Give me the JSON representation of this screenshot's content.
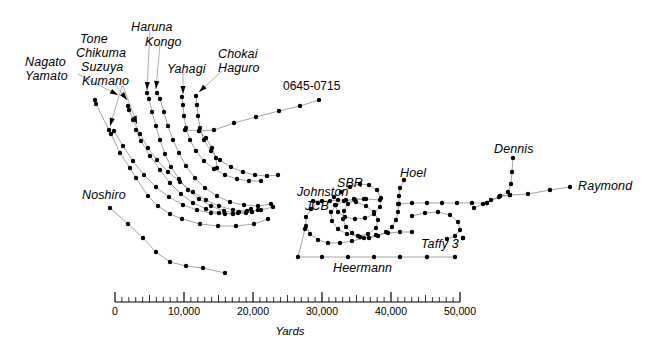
{
  "timestamp": {
    "text": "0645-0715",
    "x": 283,
    "y": 79
  },
  "style": {
    "track_color": "#8d8d8d",
    "dot_color": "#000000",
    "text_color": "#000000",
    "background": "#ffffff",
    "leader_color": "#9a9a9a"
  },
  "labels": [
    {
      "name": "nagato",
      "text": "Nagato",
      "x": 25,
      "y": 56
    },
    {
      "name": "yamato",
      "text": "Yamato",
      "x": 25,
      "y": 70
    },
    {
      "name": "tone",
      "text": "Tone",
      "x": 80,
      "y": 33
    },
    {
      "name": "chikuma",
      "text": "Chikuma",
      "x": 76,
      "y": 47
    },
    {
      "name": "suzuya",
      "text": "Suzuya",
      "x": 81,
      "y": 61
    },
    {
      "name": "kumano",
      "text": "Kumano",
      "x": 82,
      "y": 75
    },
    {
      "name": "haruna",
      "text": "Haruna",
      "x": 131,
      "y": 21
    },
    {
      "name": "kongo",
      "text": "Kongo",
      "x": 145,
      "y": 36
    },
    {
      "name": "yahagi",
      "text": "Yahagi",
      "x": 167,
      "y": 63
    },
    {
      "name": "chokai",
      "text": "Chokai",
      "x": 218,
      "y": 48
    },
    {
      "name": "haguro",
      "text": "Haguro",
      "x": 218,
      "y": 62
    },
    {
      "name": "noshiro",
      "text": "Noshiro",
      "x": 82,
      "y": 189
    },
    {
      "name": "johnston",
      "text": "Johnston",
      "x": 297,
      "y": 186
    },
    {
      "name": "jcb",
      "text": "JCB",
      "x": 305,
      "y": 200
    },
    {
      "name": "sbr",
      "text": "SBR",
      "x": 337,
      "y": 177
    },
    {
      "name": "hoel",
      "text": "Hoel",
      "x": 400,
      "y": 167
    },
    {
      "name": "dennis",
      "text": "Dennis",
      "x": 494,
      "y": 143
    },
    {
      "name": "raymond",
      "text": "Raymond",
      "x": 578,
      "y": 180
    },
    {
      "name": "taffy3",
      "text": "Taffy 3",
      "x": 421,
      "y": 238
    },
    {
      "name": "heermann",
      "text": "Heermann",
      "x": 333,
      "y": 262
    }
  ],
  "leaders": [
    {
      "name": "leader-nagato-yamato",
      "points": "78,74 118,95",
      "arrow": "118,95"
    },
    {
      "name": "leader-tone-chikuma",
      "points": "113,82 127,100",
      "arrow": "127,100"
    },
    {
      "name": "leader-suzuya",
      "points": "123,86 137,124",
      "arrow": "137,124"
    },
    {
      "name": "leader-kumano",
      "points": "122,86 110,126",
      "arrow": "110,126"
    },
    {
      "name": "leader-haruna",
      "points": "150,30 147,90",
      "arrow": "147,90"
    },
    {
      "name": "leader-kongo",
      "points": "160,44 156,89",
      "arrow": "156,89"
    },
    {
      "name": "leader-yahagi",
      "points": "183,72 183,94",
      "arrow": "183,94"
    },
    {
      "name": "leader-chokai-haguro",
      "points": "222,71 199,92",
      "arrow": "199,92"
    }
  ],
  "scale": {
    "name": "yards-scale-bar",
    "x0": 115,
    "x1": 460,
    "y": 302,
    "max_yards": 50000,
    "minor_step": 1000,
    "major_step": 10000,
    "unit_label": "Yards",
    "unit_x": 290,
    "unit_y": 325,
    "tick_labels": [
      {
        "value": 0,
        "text": "0"
      },
      {
        "value": 10000,
        "text": "10,000"
      },
      {
        "value": 20000,
        "text": "20,000"
      },
      {
        "value": 30000,
        "text": "30,000"
      },
      {
        "value": 40000,
        "text": "40,000"
      },
      {
        "value": 50000,
        "text": "50,000"
      }
    ]
  },
  "chart_data": {
    "type": "scatter",
    "xlabel": "Yards",
    "ylabel": "",
    "grid": false,
    "legend": "inline-labels",
    "note": "Each series is a ship track: ordered plotted positions (screen px) joined by a thin line with a dot at each timed position.",
    "series": [
      {
        "name": "Nagato/Yamato",
        "points": "95,100 96,104 109,130 111,134 120,153 130,168 136,178 148,196 158,206 170,214 182,219 200,224 218,226 236,226 254,224 268,219"
      },
      {
        "name": "Tone/Chikuma",
        "points": "128,106 129,110 133,120 140,134 148,148 157,160 168,172 180,182 193,192 206,200 219,206 233,210 247,211 261,210 273,207"
      },
      {
        "name": "Suzuya",
        "points": "136,130 141,141 150,156 160,170 170,183 181,194 193,203 206,209 219,213 233,214 246,213 258,210"
      },
      {
        "name": "Kumano",
        "points": "114,131 123,146 133,161 144,175 156,187 169,197 183,205 197,210 211,213 225,214 239,212 251,209"
      },
      {
        "name": "Haruna",
        "points": "147,93 149,99 152,112 156,126 160,140 165,154 171,167 179,179 188,190 199,199 211,206 224,211 238,213 252,212"
      },
      {
        "name": "Kongo",
        "points": "157,93 160,99 164,112 168,126 173,140 179,153 186,166 195,178 205,188 217,196 230,202 244,205 258,206 271,204"
      },
      {
        "name": "Yahagi",
        "points": "182,97 183,105 184,116 186,128 190,140 196,151 204,161 214,169 225,175 237,179 249,181 261,181"
      },
      {
        "name": "Chokai/Haguro",
        "points": "196,96 197,105 198,116 200,128 204,140 211,151 220,160 231,167 243,172 255,175 267,176 278,175"
      },
      {
        "name": "Japanese-column-east",
        "points": "199,131 214,130 234,123 256,117 279,111 300,106 319,100"
      },
      {
        "name": "Japanese-column-link",
        "points": "185,130 199,131 206,138 212,148 216,158 217,168"
      },
      {
        "name": "Noshiro",
        "points": "110,208 128,224 143,238 156,252 170,262 186,266 203,268 225,273"
      },
      {
        "name": "Johnston",
        "points": "313,201 322,201 330,201 338,200 346,200 356,202 366,206 374,212 378,220 376,228 368,234 358,236 347,234 338,229 332,221 331,212 336,205 344,201 354,199 366,199 380,200"
      },
      {
        "name": "JCB",
        "points": "318,203 311,209 306,217 306,226 310,234 318,240 328,243 340,243 352,241 364,238 376,235 388,233 400,232 412,232"
      },
      {
        "name": "SBR",
        "points": "334,197 341,192 350,187 360,184 369,185 377,190 381,198 380,207 374,214 365,218 355,219 345,217 338,212 335,205"
      },
      {
        "name": "Hoel",
        "points": "404,180 400,188 399,196 399,204 398,212 396,220 392,227 386,232 378,236 369,238 360,237 352,233 346,227 343,219 344,211 348,204 355,200 364,199"
      },
      {
        "name": "Heermann",
        "points": "305,229 298,257 322,257 348,257 374,257 400,257 427,257 455,257"
      },
      {
        "name": "Dennis",
        "points": "513,158 512,172 511,184 508,192 500,196 491,200 483,204 474,208"
      },
      {
        "name": "Raymond",
        "points": "570,187 550,190 528,194 510,195 500,196"
      },
      {
        "name": "Taffy3-carrier-line",
        "points": "398,204 412,203 427,203 442,203 457,203 472,203 487,203"
      },
      {
        "name": "Taffy3-east-link",
        "points": "487,203 499,197 510,195"
      },
      {
        "name": "Taffy3-inner",
        "points": "412,216 425,213 438,212 450,215 458,222 460,230 455,236 447,239"
      },
      {
        "name": "Taffy3-marker",
        "points": "463,238 463,238"
      }
    ]
  }
}
